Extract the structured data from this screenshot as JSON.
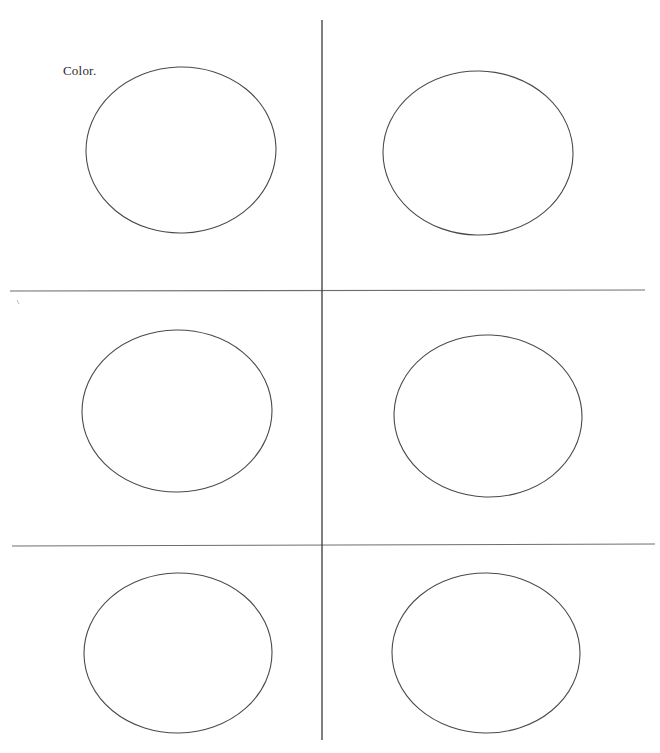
{
  "page": {
    "title": "Color.",
    "background_color": "#ffffff",
    "width": 660,
    "height": 753
  },
  "labels": [
    {
      "name": "color-label",
      "text": "Color.",
      "x": 63,
      "y": 64,
      "font_size": 13,
      "color": "#2a2a2a"
    }
  ],
  "rules": {
    "stroke_color": "#3a3a3a",
    "horizontal_color": "#6e6e6e",
    "items": [
      {
        "name": "vertical-divider",
        "orientation": "vertical",
        "x1": 322,
        "y1": 20,
        "x2": 322,
        "y2": 740,
        "width": 1.3,
        "color": "#3a3a3a"
      },
      {
        "name": "horizontal-divider-upper",
        "orientation": "horizontal",
        "x1": 10,
        "y1": 291,
        "x2": 645,
        "y2": 290,
        "width": 1.1,
        "color": "#6e6e6e"
      },
      {
        "name": "horizontal-divider-lower",
        "orientation": "horizontal",
        "x1": 12,
        "y1": 546,
        "x2": 655,
        "y2": 544,
        "width": 1.1,
        "color": "#6e6e6e"
      }
    ]
  },
  "tick_marks": [
    {
      "name": "left-margin-tick",
      "x": 18,
      "y": 302,
      "color": "#bdbdbd"
    }
  ],
  "circles": {
    "stroke_color": "#4a4a4a",
    "stroke_width": 1.1,
    "fill": "none",
    "rows": 3,
    "columns": 2,
    "items": [
      {
        "name": "circle-row1-col1",
        "row": 1,
        "col": 1,
        "cx": 181,
        "cy": 150,
        "rx": 95,
        "ry": 83
      },
      {
        "name": "circle-row1-col2",
        "row": 1,
        "col": 2,
        "cx": 478,
        "cy": 153,
        "rx": 95,
        "ry": 82
      },
      {
        "name": "circle-row2-col1",
        "row": 2,
        "col": 1,
        "cx": 177,
        "cy": 411,
        "rx": 95,
        "ry": 81
      },
      {
        "name": "circle-row2-col2",
        "row": 2,
        "col": 2,
        "cx": 488,
        "cy": 416,
        "rx": 94,
        "ry": 81
      },
      {
        "name": "circle-row3-col1",
        "row": 3,
        "col": 1,
        "cx": 178,
        "cy": 653,
        "rx": 94,
        "ry": 80
      },
      {
        "name": "circle-row3-col2",
        "row": 3,
        "col": 2,
        "cx": 486,
        "cy": 653,
        "rx": 94,
        "ry": 80
      }
    ]
  }
}
